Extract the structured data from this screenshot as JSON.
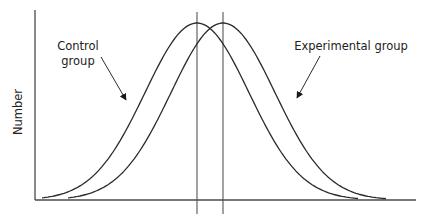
{
  "chart_data": {
    "type": "line",
    "title": "",
    "xlabel": "",
    "ylabel": "Number",
    "grid": false,
    "legend": "none (inline annotations with arrows)",
    "annotations": [
      {
        "text_lines": [
          "Control",
          "group"
        ],
        "points_to": "Control group curve (left rising side)"
      },
      {
        "text_lines": [
          "Experimental group"
        ],
        "points_to": "Experimental group curve (right falling side)"
      }
    ],
    "series": [
      {
        "name": "Control group",
        "shape": "normal distribution (bell curve)",
        "mean_position": "left vertical line",
        "x": [
          0,
          0.1,
          0.2,
          0.3,
          0.4,
          0.5,
          0.6,
          0.7,
          0.8,
          0.9,
          1.0
        ],
        "values": [
          0,
          0.05,
          0.2,
          0.5,
          0.82,
          1.0,
          0.82,
          0.5,
          0.2,
          0.05,
          0
        ]
      },
      {
        "name": "Experimental group",
        "shape": "normal distribution (bell curve), same spread, shifted right",
        "mean_position": "right vertical line",
        "x": [
          0.09,
          0.19,
          0.29,
          0.39,
          0.49,
          0.59,
          0.69,
          0.79,
          0.89,
          0.99,
          1.09
        ],
        "values": [
          0,
          0.05,
          0.2,
          0.5,
          0.82,
          1.0,
          0.82,
          0.5,
          0.2,
          0.05,
          0
        ]
      }
    ],
    "reference_lines": [
      {
        "name": "Control group mean",
        "orientation": "vertical"
      },
      {
        "name": "Experimental group mean",
        "orientation": "vertical"
      }
    ]
  },
  "labels": {
    "y_axis": "Number",
    "control_line1": "Control",
    "control_line2": "group",
    "experimental": "Experimental group"
  }
}
